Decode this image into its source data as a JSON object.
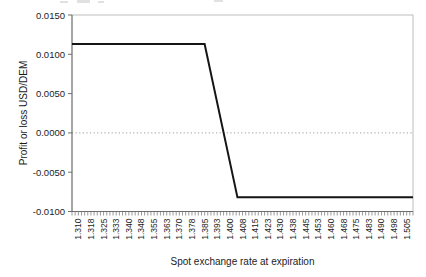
{
  "chart_data": {
    "type": "line",
    "title": "",
    "xlabel": "Spot exchange rate at expiration",
    "ylabel": "Profit or loss USD/DEM",
    "x_categories": [
      "1.310",
      "1.318",
      "1.325",
      "1.333",
      "1.340",
      "1.348",
      "1.355",
      "1.363",
      "1.370",
      "1.378",
      "1.385",
      "1.393",
      "1.400",
      "1.408",
      "1.415",
      "1.423",
      "1.430",
      "1.438",
      "1.445",
      "1.453",
      "1.460",
      "1.468",
      "1.475",
      "1.483",
      "1.490",
      "1.498",
      "1.505"
    ],
    "yticks": [
      "0.0150",
      "0.0100",
      "0.0050",
      "0.0000",
      "-0.0050",
      "-0.0100"
    ],
    "ylim": [
      -0.01,
      0.015
    ],
    "xlim": [
      1.31,
      1.505
    ],
    "minor_ticks_per_category": 4,
    "grid": "dotted horizontal line at zero only",
    "legend": "none",
    "series": [
      {
        "name": "option-payoff",
        "color": "#151515",
        "points": [
          [
            1.31,
            0.0113
          ],
          [
            1.385,
            0.0113
          ],
          [
            1.4045,
            -0.0082
          ],
          [
            1.505,
            -0.0082
          ]
        ]
      }
    ],
    "colors": {
      "axis": "#6e6e6e",
      "plot_border": "#bdbdbd",
      "zero_line": "#9e9e9e",
      "text": "#1c1c1c",
      "background": "#ffffff"
    }
  }
}
